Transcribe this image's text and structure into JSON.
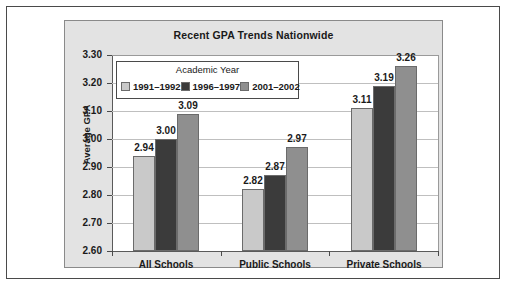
{
  "chart_data": {
    "type": "bar",
    "title": "Recent GPA Trends Nationwide",
    "xlabel": "",
    "ylabel": "Average GPA",
    "categories": [
      "All Schools",
      "Public Schools",
      "Private Schools"
    ],
    "series": [
      {
        "name": "1991–1992",
        "color": "#c9c9c9",
        "values": [
          2.94,
          2.82,
          3.11
        ]
      },
      {
        "name": "1996–1997",
        "color": "#3b3b3b",
        "values": [
          3.0,
          2.87,
          3.19
        ]
      },
      {
        "name": "2001–2002",
        "color": "#8f8f8f",
        "values": [
          3.09,
          2.97,
          3.26
        ]
      }
    ],
    "value_labels": [
      [
        "2.94",
        "3.00",
        "3.09"
      ],
      [
        "2.82",
        "2.87",
        "2.97"
      ],
      [
        "3.11",
        "3.19",
        "3.26"
      ]
    ],
    "ylim": [
      2.6,
      3.3
    ],
    "ytick_labels": [
      "3.30",
      "3.20",
      "3.10",
      "3.00",
      "2.90",
      "2.80",
      "2.70",
      "2.60"
    ],
    "ytick_values": [
      3.3,
      3.2,
      3.1,
      3.0,
      2.9,
      2.8,
      2.7,
      2.6
    ],
    "grid": true,
    "legend": {
      "title": "Academic Year",
      "position": "inside-top-left"
    }
  },
  "colors": {
    "panel_background": "#e3e3e3",
    "plot_background": "#ffffff",
    "axis": "#4a4a4a",
    "gridline": "#bfbfbf",
    "text": "#1a1a1a"
  }
}
